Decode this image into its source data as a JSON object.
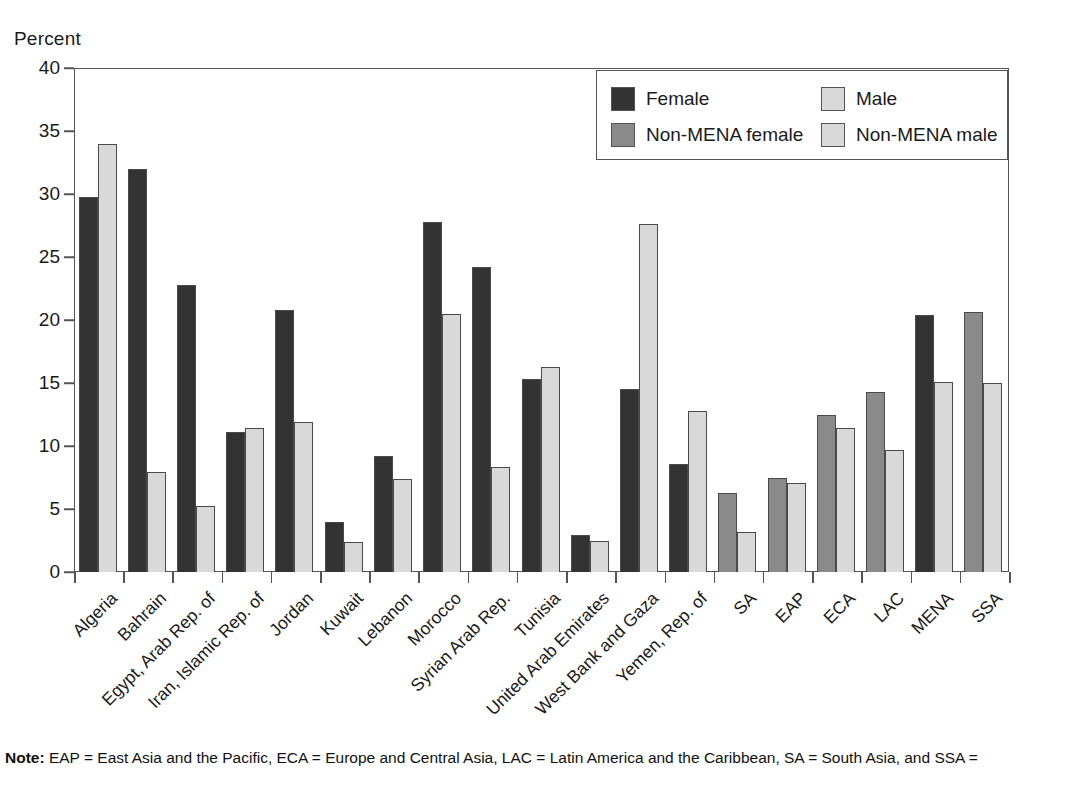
{
  "chart_data": {
    "type": "bar",
    "title": "",
    "subtitle": "",
    "xlabel": "",
    "ylabel": "Percent",
    "ylim": [
      0,
      40
    ],
    "yticks": [
      0,
      5,
      10,
      15,
      20,
      25,
      30,
      35,
      40
    ],
    "ytick_labels": [
      "0",
      "5",
      "10",
      "15",
      "20",
      "25",
      "30",
      "35",
      "40"
    ],
    "grid": false,
    "legend_position": "top-right",
    "legend": [
      "Female",
      "Male",
      "Non-MENA female",
      "Non-MENA male"
    ],
    "categories": [
      "Algeria",
      "Bahrain",
      "Egypt, Arab Rep. of",
      "Iran, Islamic Rep. of",
      "Jordan",
      "Kuwait",
      "Lebanon",
      "Morocco",
      "Syrian Arab Rep.",
      "Tunisia",
      "United Arab Emirates",
      "West Bank and Gaza",
      "Yemen, Rep. of",
      "SA",
      "EAP",
      "ECA",
      "LAC",
      "MENA",
      "SSA"
    ],
    "category_group": [
      "mena",
      "mena",
      "mena",
      "mena",
      "mena",
      "mena",
      "mena",
      "mena",
      "mena",
      "mena",
      "mena",
      "mena",
      "mena",
      "non-mena",
      "non-mena",
      "non-mena",
      "non-mena",
      "mena",
      "non-mena"
    ],
    "series": [
      {
        "name": "Female",
        "key": "female",
        "values": [
          29.8,
          32.0,
          22.8,
          11.1,
          20.8,
          4.0,
          9.2,
          27.8,
          24.2,
          15.3,
          2.9,
          14.5,
          8.6,
          6.3,
          7.5,
          12.5,
          14.3,
          20.4,
          20.6
        ]
      },
      {
        "name": "Male",
        "key": "male",
        "values": [
          34.0,
          7.9,
          5.2,
          11.4,
          11.9,
          2.4,
          7.4,
          20.5,
          8.3,
          16.3,
          2.5,
          27.6,
          12.8,
          3.2,
          7.1,
          11.4,
          9.7,
          15.1,
          15.0
        ]
      }
    ],
    "colors": {
      "female": "#333333",
      "male": "#d9d9d9",
      "non_mena_female": "#8a8a8a",
      "non_mena_male": "#d9d9d9",
      "bar_edge": "#4a4a4a",
      "axis": "#555555",
      "text": "#1a1a1a"
    }
  },
  "axis": {
    "ylabel": "Percent",
    "ytick_labels": [
      "40",
      "35",
      "30",
      "25",
      "20",
      "15",
      "10",
      "5",
      "0"
    ]
  },
  "legend": {
    "items": [
      {
        "label": "Female",
        "swatch": "#333333"
      },
      {
        "label": "Male",
        "swatch": "#d9d9d9"
      },
      {
        "label": "Non-MENA female",
        "swatch": "#8a8a8a"
      },
      {
        "label": "Non-MENA male",
        "swatch": "#d9d9d9"
      }
    ]
  },
  "note": {
    "prefix": "Note:",
    "text": " EAP = East Asia and the Pacific, ECA = Europe and Central Asia, LAC = Latin America and the Caribbean, SA = South Asia, and SSA ="
  }
}
